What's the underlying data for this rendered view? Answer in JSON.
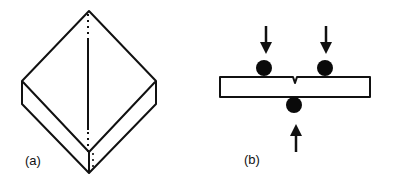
{
  "figure": {
    "panels": [
      {
        "id": "a",
        "label": "(a)",
        "description": "Isometric view of square slab/plate with diagonal line"
      },
      {
        "id": "b",
        "label": "(b)",
        "description": "Notched bar under three-point bending with loading rollers and force arrows"
      }
    ],
    "colors": {
      "stroke": "#111111",
      "fill": "#ffffff",
      "roller": "#0a0a0a"
    }
  }
}
